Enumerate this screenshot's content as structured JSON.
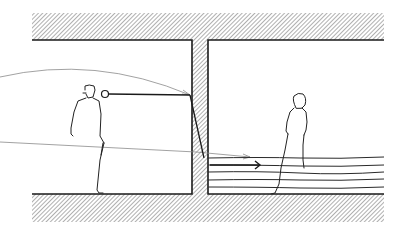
{
  "diagram": {
    "style": "pen-and-ink hand sketch",
    "colors": {
      "background": "#ffffff",
      "ink": "#1a1a1a",
      "hatch": "#7a7a7a",
      "thin_line": "#8a8a8a"
    },
    "elements": {
      "ceiling": {
        "label": "hatched ceiling slab"
      },
      "floor": {
        "label": "hatched floor slab"
      },
      "divider_wall": {
        "label": "hatched dividing wall"
      },
      "left_room": {
        "label": "left room"
      },
      "right_room": {
        "label": "right room"
      },
      "left_figure": {
        "label": "standing figure (left room)"
      },
      "right_figure": {
        "label": "standing figure (right room)"
      },
      "viewpoint": {
        "label": "eye / viewpoint circle with sight line"
      },
      "sight_line_upper": {
        "label": "curved sight line from outside to wall"
      },
      "sight_line_lower": {
        "label": "straight sight line crossing into right room"
      },
      "arrow": {
        "label": "direction arrow"
      },
      "floor_lines": {
        "label": "horizontal lines in right room"
      }
    }
  }
}
